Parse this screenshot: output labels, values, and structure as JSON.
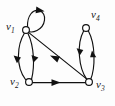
{
  "figure": {
    "background_color": "#fdfdfd",
    "stroke_color": "#111111",
    "node_fill_color": "#ffffff",
    "width": 115,
    "height": 106
  },
  "nodes": [
    {
      "id": "v1",
      "label": "v",
      "subscript": "1",
      "x": 26,
      "y": 30,
      "r": 3.4
    },
    {
      "id": "v2",
      "label": "v",
      "subscript": "2",
      "x": 29,
      "y": 82,
      "r": 3.4
    },
    {
      "id": "v3",
      "label": "v",
      "subscript": "3",
      "x": 89,
      "y": 82,
      "r": 3.4
    },
    {
      "id": "v4",
      "label": "v",
      "subscript": "4",
      "x": 86,
      "y": 28,
      "r": 3.4
    }
  ],
  "edges": [
    {
      "id": "e1",
      "from": "v1",
      "to": "v1",
      "kind": "self-loop",
      "direction": "clockwise"
    },
    {
      "id": "e2",
      "from": "v1",
      "to": "v2",
      "kind": "curve-left",
      "direction": "down"
    },
    {
      "id": "e3",
      "from": "v1",
      "to": "v2",
      "kind": "curve-right",
      "direction": "down"
    },
    {
      "id": "e4",
      "from": "v2",
      "to": "v3",
      "kind": "straight",
      "direction": "right"
    },
    {
      "id": "e5",
      "from": "v3",
      "to": "v1",
      "kind": "straight-diagonal",
      "direction": "up-left"
    },
    {
      "id": "e6",
      "from": "v3",
      "to": "v4",
      "kind": "curve-left",
      "direction": "up"
    },
    {
      "id": "e7",
      "from": "v4",
      "to": "v3",
      "kind": "curve-right",
      "direction": "down"
    }
  ]
}
